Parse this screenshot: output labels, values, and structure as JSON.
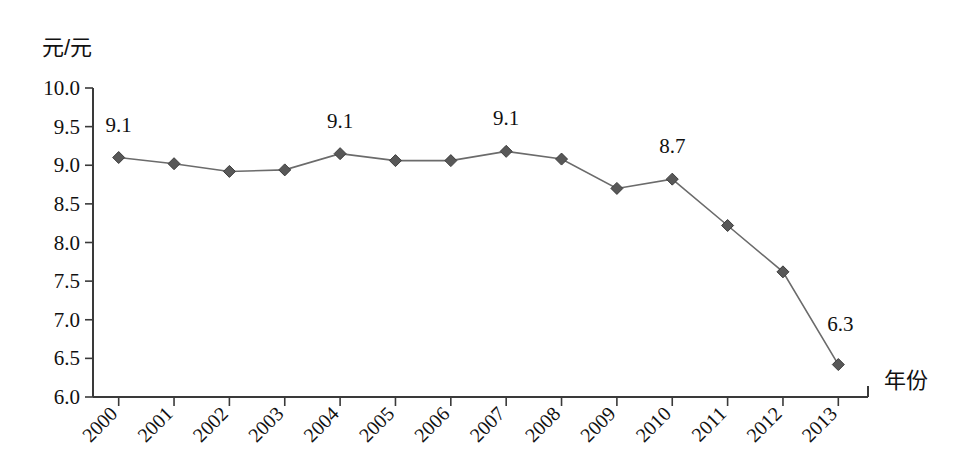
{
  "chart_data": {
    "type": "line",
    "title": "",
    "subtitle": "",
    "xlabel": "年份",
    "ylabel": "元/元",
    "categories": [
      "2000",
      "2001",
      "2002",
      "2003",
      "2004",
      "2005",
      "2006",
      "2007",
      "2008",
      "2009",
      "2010",
      "2011",
      "2012",
      "2013"
    ],
    "x": [
      2000,
      2001,
      2002,
      2003,
      2004,
      2005,
      2006,
      2007,
      2008,
      2009,
      2010,
      2011,
      2012,
      2013
    ],
    "values": [
      9.1,
      9.02,
      8.92,
      8.94,
      9.15,
      9.06,
      9.06,
      9.18,
      9.08,
      8.7,
      8.82,
      8.22,
      7.62,
      6.42
    ],
    "ylim": [
      6.0,
      10.0
    ],
    "yticks": [
      "6.0",
      "6.5",
      "7.0",
      "7.5",
      "8.0",
      "8.5",
      "9.0",
      "9.5",
      "10.0"
    ],
    "ytick_values": [
      6.0,
      6.5,
      7.0,
      7.5,
      8.0,
      8.5,
      9.0,
      9.5,
      10.0
    ],
    "grid": false,
    "legend": false,
    "legend_position": "none",
    "marker": "diamond",
    "line_color": "#6b6b6b",
    "marker_color": "#585858",
    "annotations": [
      {
        "category": "2000",
        "text": "9.1",
        "value": 9.1
      },
      {
        "category": "2004",
        "text": "9.1",
        "value": 9.15
      },
      {
        "category": "2007",
        "text": "9.1",
        "value": 9.18
      },
      {
        "category": "2010",
        "text": "8.7",
        "value": 8.82
      },
      {
        "category": "2013",
        "text": "6.3",
        "value": 6.42
      }
    ]
  },
  "axes": {
    "y_axis_label": "元/元",
    "x_axis_label": "年份"
  }
}
